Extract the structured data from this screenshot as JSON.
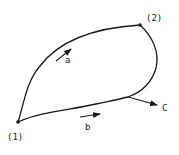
{
  "diagram": {
    "type": "closed-curve-path-diagram",
    "stroke_color": "#1a1a1a",
    "background": "#ffffff",
    "points": [
      {
        "id": "p1",
        "label": "(1)"
      },
      {
        "id": "p2",
        "label": "(2)"
      }
    ],
    "paths": [
      {
        "id": "a",
        "label": "a",
        "from": "(1)",
        "to": "(2)"
      },
      {
        "id": "b",
        "label": "b",
        "from": "(1)",
        "to": "(2)"
      }
    ],
    "boundary_arrow": {
      "label": "C"
    }
  }
}
